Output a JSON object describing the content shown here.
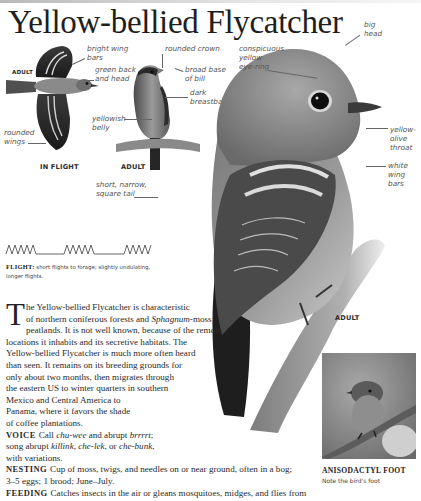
{
  "page": {
    "title": "Yellow-bellied Flycatcher"
  },
  "illustrations": {
    "flight_bird": {
      "age_label": "ADULT",
      "caption": "IN FLIGHT",
      "labels": {
        "wing_bars": "bright wing\nbars",
        "back": "green back\nand head",
        "wings": "rounded\nwings"
      }
    },
    "perched_small": {
      "caption": "ADULT",
      "labels": {
        "crown": "rounded crown",
        "bill": "broad base\nof bill",
        "breastband": "dark\nbreastband",
        "belly": "yellowish\nbelly",
        "tail": "short, narrow,\nsquare tail"
      }
    },
    "perched_large": {
      "caption": "ADULT",
      "labels": {
        "head": "big\nhead",
        "eye_ring": "conspicuous\nyellow\neye-ring",
        "throat": "yellow-\nolive\nthroat",
        "wing_bars": "white\nwing\nbars"
      }
    }
  },
  "flight": {
    "label": "FLIGHT:",
    "text": "short flights to forage; slightly undulating, longer flights."
  },
  "description": {
    "dropcap": "T",
    "lines": [
      "he Yellow-bellied Flycatcher is characteristic",
      "of northern coniferous forests and ",
      "peatlands. It is not well known, because of the remote",
      "locations it inhabits and its secretive habitats. The",
      "Yellow-bellied Flycatcher is much more often heard",
      "than seen. It remains on its breeding grounds for",
      "only about two months, then migrates through",
      "the eastern US to winter quarters in southern",
      "Mexico and Central America to",
      "Panama, where it favors the shade",
      "of coffee plantations."
    ],
    "italic_term": "Sphagnum",
    "italic_suffix": "-moss"
  },
  "voice": {
    "label": "VOICE",
    "pre": "Call ",
    "call1": "chu-wee",
    "mid": " and abrupt ",
    "call2": "brrrrt",
    "song_pre": "song abrupt ",
    "song1": "killink",
    "song2": "che-lek",
    "song_or": ", or ",
    "song3": "che-bunk",
    "end": "with variations."
  },
  "nesting": {
    "label": "NESTING",
    "line1": "Cup of moss, twigs, and needles on or near ground, often in a bog;",
    "line2": "3–5 eggs; 1 brood; June–July."
  },
  "feeding": {
    "label": "FEEDING",
    "line1": "Catches insects in the air or gleans mosquitoes, midges, and flies from"
  },
  "inset": {
    "caption": "ANISODACTYL FOOT",
    "subcaption": "Note the bird's foot"
  }
}
